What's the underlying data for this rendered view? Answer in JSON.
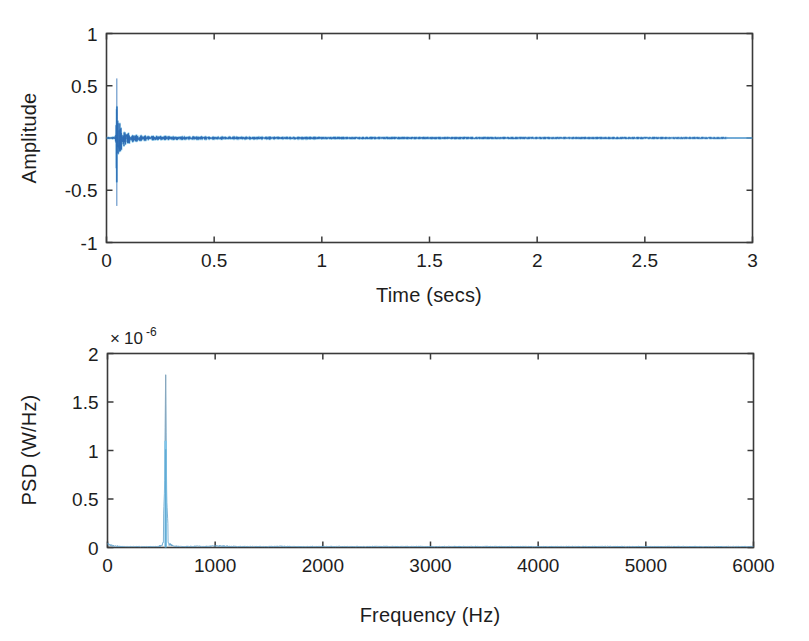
{
  "figure": {
    "background_color": "#ffffff",
    "axis_color": "#3a3a3a",
    "text_color": "#1d1d1d",
    "trace_color_dark": "#2f6eb5",
    "trace_color_light": "#7fc4e8"
  },
  "chart_data": [
    {
      "id": "time-domain",
      "type": "line",
      "title": "",
      "xlabel": "Time (secs)",
      "ylabel": "Amplitude",
      "xlim": [
        0,
        3
      ],
      "ylim": [
        -1,
        1
      ],
      "xticks": [
        0,
        0.5,
        1,
        1.5,
        2,
        2.5,
        3
      ],
      "xticklabels": [
        "0",
        "0.5",
        "1",
        "1.5",
        "2",
        "2.5",
        "3"
      ],
      "yticks": [
        -1,
        -0.5,
        0,
        0.5,
        1
      ],
      "yticklabels": [
        "-1",
        "-0.5",
        "0",
        "0.5",
        "1"
      ],
      "grid": false,
      "legend": null,
      "series": [
        {
          "name": "Acoustic waveform",
          "color": "#2f6eb5",
          "description": "Impulsive transient near t = 0.05 s decaying into low-level noise floor",
          "envelope_upper": [
            [
              0.0,
              0.004
            ],
            [
              0.02,
              0.006
            ],
            [
              0.035,
              0.01
            ],
            [
              0.044,
              0.03
            ],
            [
              0.048,
              0.57
            ],
            [
              0.05,
              0.3
            ],
            [
              0.052,
              0.17
            ],
            [
              0.055,
              0.21
            ],
            [
              0.058,
              0.13
            ],
            [
              0.062,
              0.15
            ],
            [
              0.066,
              0.095
            ],
            [
              0.07,
              0.11
            ],
            [
              0.075,
              0.07
            ],
            [
              0.08,
              0.082
            ],
            [
              0.086,
              0.055
            ],
            [
              0.092,
              0.062
            ],
            [
              0.1,
              0.045
            ],
            [
              0.11,
              0.048
            ],
            [
              0.12,
              0.036
            ],
            [
              0.135,
              0.032
            ],
            [
              0.15,
              0.026
            ],
            [
              0.17,
              0.024
            ],
            [
              0.2,
              0.02
            ],
            [
              0.25,
              0.017
            ],
            [
              0.3,
              0.015
            ],
            [
              0.4,
              0.013
            ],
            [
              0.5,
              0.012
            ],
            [
              0.7,
              0.011
            ],
            [
              0.9,
              0.01
            ],
            [
              1.2,
              0.009
            ],
            [
              1.5,
              0.008
            ],
            [
              1.8,
              0.007
            ],
            [
              2.1,
              0.007
            ],
            [
              2.4,
              0.006
            ],
            [
              2.7,
              0.006
            ],
            [
              2.88,
              0.005
            ],
            [
              3.0,
              0.0
            ]
          ],
          "envelope_lower": [
            [
              0.0,
              -0.004
            ],
            [
              0.02,
              -0.006
            ],
            [
              0.035,
              -0.01
            ],
            [
              0.044,
              -0.04
            ],
            [
              0.048,
              -0.65
            ],
            [
              0.05,
              -0.32
            ],
            [
              0.052,
              -0.18
            ],
            [
              0.055,
              -0.23
            ],
            [
              0.058,
              -0.14
            ],
            [
              0.062,
              -0.16
            ],
            [
              0.066,
              -0.1
            ],
            [
              0.07,
              -0.115
            ],
            [
              0.075,
              -0.075
            ],
            [
              0.08,
              -0.086
            ],
            [
              0.086,
              -0.058
            ],
            [
              0.092,
              -0.065
            ],
            [
              0.1,
              -0.047
            ],
            [
              0.11,
              -0.05
            ],
            [
              0.12,
              -0.038
            ],
            [
              0.135,
              -0.034
            ],
            [
              0.15,
              -0.027
            ],
            [
              0.17,
              -0.025
            ],
            [
              0.2,
              -0.021
            ],
            [
              0.25,
              -0.018
            ],
            [
              0.3,
              -0.016
            ],
            [
              0.4,
              -0.014
            ],
            [
              0.5,
              -0.013
            ],
            [
              0.7,
              -0.012
            ],
            [
              0.9,
              -0.011
            ],
            [
              1.2,
              -0.01
            ],
            [
              1.5,
              -0.009
            ],
            [
              1.8,
              -0.008
            ],
            [
              2.1,
              -0.007
            ],
            [
              2.4,
              -0.007
            ],
            [
              2.7,
              -0.006
            ],
            [
              2.88,
              -0.005
            ],
            [
              3.0,
              0.0
            ]
          ],
          "peak_positive": 0.57,
          "peak_negative": -0.65,
          "peak_time": 0.048,
          "signal_end_time": 2.88
        }
      ]
    },
    {
      "id": "psd",
      "type": "line",
      "title": "",
      "xlabel": "Frequency (Hz)",
      "ylabel": "PSD (W/Hz)",
      "y_exponent_text": "10",
      "y_exponent_prefix": "×",
      "y_exponent_power": "-6",
      "y_scale_factor": 1e-06,
      "xlim": [
        0,
        6000
      ],
      "ylim": [
        0,
        2
      ],
      "xticks": [
        0,
        1000,
        2000,
        3000,
        4000,
        5000,
        6000
      ],
      "xticklabels": [
        "0",
        "1000",
        "2000",
        "3000",
        "4000",
        "5000",
        "6000"
      ],
      "yticks": [
        0,
        0.5,
        1,
        1.5,
        2
      ],
      "yticklabels": [
        "0",
        "0.5",
        "1",
        "1.5",
        "2"
      ],
      "grid": false,
      "legend": null,
      "series": [
        {
          "name": "Power spectral density",
          "color": "#7fc4e8",
          "description": "Single dominant narrowband peak near 540 Hz, noise floor elsewhere",
          "peak_frequency": 540,
          "peak_value": 1.78,
          "peak_value_core": 1.1,
          "points": [
            [
              0,
              0.03
            ],
            [
              20,
              0.022
            ],
            [
              60,
              0.014
            ],
            [
              120,
              0.01
            ],
            [
              200,
              0.008
            ],
            [
              300,
              0.008
            ],
            [
              400,
              0.009
            ],
            [
              470,
              0.01
            ],
            [
              510,
              0.02
            ],
            [
              530,
              0.6
            ],
            [
              540,
              1.78
            ],
            [
              550,
              0.5
            ],
            [
              570,
              0.03
            ],
            [
              620,
              0.012
            ],
            [
              700,
              0.01
            ],
            [
              800,
              0.012
            ],
            [
              900,
              0.01
            ],
            [
              1000,
              0.014
            ],
            [
              1200,
              0.01
            ],
            [
              1400,
              0.009
            ],
            [
              1600,
              0.011
            ],
            [
              1800,
              0.009
            ],
            [
              2000,
              0.01
            ],
            [
              2300,
              0.009
            ],
            [
              2600,
              0.01
            ],
            [
              3000,
              0.009
            ],
            [
              3400,
              0.01
            ],
            [
              3800,
              0.009
            ],
            [
              4200,
              0.009
            ],
            [
              4600,
              0.01
            ],
            [
              5000,
              0.009
            ],
            [
              5400,
              0.009
            ],
            [
              5800,
              0.008
            ],
            [
              6000,
              0.008
            ]
          ]
        }
      ]
    }
  ]
}
